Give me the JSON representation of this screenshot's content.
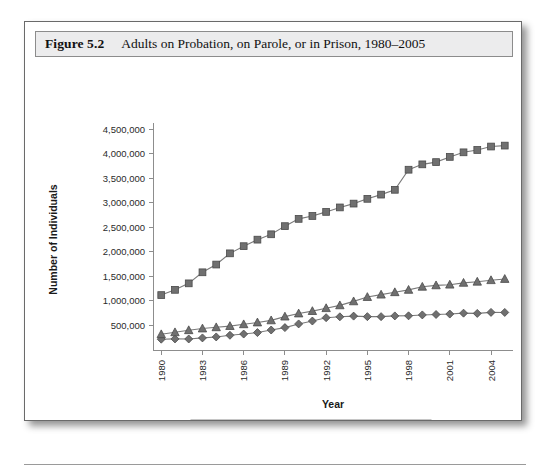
{
  "figure": {
    "number": "Figure 5.2",
    "caption": "Adults on Probation, on Parole, or in Prison, 1980–2005"
  },
  "colors": {
    "marker_fill": "#707070",
    "marker_stroke": "#4a4a4a",
    "line": "#7a7a7a",
    "axis": "#8d8d8d",
    "title_band": "#ececed",
    "figure_border": "#6a6a6a"
  },
  "legend": {
    "position": "bottom",
    "items": [
      {
        "label": "Probation",
        "marker": "square"
      },
      {
        "label": "Parole",
        "marker": "diamond"
      },
      {
        "label": "Prison",
        "marker": "triangle"
      }
    ]
  },
  "chart_data": {
    "type": "line",
    "title": "Adults on Probation, on Parole, or in Prison, 1980–2005",
    "xlabel": "Year",
    "ylabel": "Number of Individuals",
    "grid": false,
    "legend_position": "bottom",
    "ylim": [
      0,
      4500000
    ],
    "yticks": [
      500000,
      1000000,
      1500000,
      2000000,
      2500000,
      3000000,
      3500000,
      4000000,
      4500000
    ],
    "ytick_labels": [
      "500,000",
      "1,000,000",
      "1,500,000",
      "2,000,000",
      "2,500,000",
      "3,000,000",
      "3,500,000",
      "4,000,000",
      "4,500,000"
    ],
    "x": [
      1980,
      1981,
      1982,
      1983,
      1984,
      1985,
      1986,
      1987,
      1988,
      1989,
      1990,
      1991,
      1992,
      1993,
      1994,
      1995,
      1996,
      1997,
      1998,
      1999,
      2000,
      2001,
      2002,
      2003,
      2004,
      2005
    ],
    "xtick_labels": [
      "1980",
      "1983",
      "1986",
      "1989",
      "1992",
      "1995",
      "1998",
      "2001",
      "2004"
    ],
    "xtick_values": [
      1980,
      1983,
      1986,
      1989,
      1992,
      1995,
      1998,
      2001,
      2004
    ],
    "series": [
      {
        "name": "Probation",
        "marker": "square",
        "values": [
          1118000,
          1225000,
          1357000,
          1582000,
          1740000,
          1968000,
          2114000,
          2247000,
          2356000,
          2522000,
          2670000,
          2729000,
          2812000,
          2903000,
          2981000,
          3078000,
          3164000,
          3262000,
          3671000,
          3780000,
          3826000,
          3932000,
          4025000,
          4073000,
          4143000,
          4162000
        ]
      },
      {
        "name": "Parole",
        "marker": "diamond",
        "values": [
          220000,
          226000,
          224000,
          246000,
          266000,
          300000,
          325000,
          355000,
          407000,
          456000,
          531000,
          590000,
          658000,
          676000,
          690000,
          679000,
          679000,
          694000,
          696000,
          714000,
          723000,
          732000,
          750000,
          745000,
          766000,
          765000
        ]
      },
      {
        "name": "Prison",
        "marker": "triangle",
        "values": [
          320000,
          360000,
          402000,
          437000,
          462000,
          487000,
          523000,
          560000,
          603000,
          680000,
          743000,
          792000,
          851000,
          909000,
          990000,
          1078000,
          1127000,
          1176000,
          1224000,
          1287000,
          1316000,
          1330000,
          1367000,
          1390000,
          1421000,
          1446000
        ]
      }
    ]
  }
}
